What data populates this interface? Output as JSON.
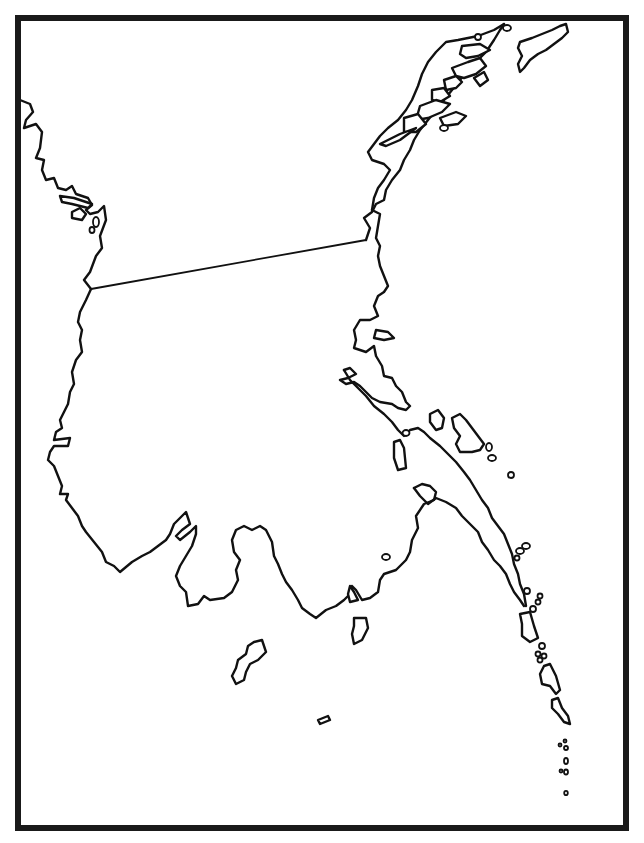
{
  "map": {
    "type": "blank-outline-map",
    "width": 644,
    "height": 843,
    "background_color": "#ffffff",
    "line_color": "#111111",
    "frame": {
      "style": "thick-hand-drawn-border",
      "color": "#1a1a1a",
      "x": 18,
      "y": 18,
      "width": 608,
      "height": 810
    },
    "labels": [],
    "features": [
      {
        "id": "northwest-coast",
        "kind": "coastline"
      },
      {
        "id": "northeast-coast-archipelago",
        "kind": "coastline"
      },
      {
        "id": "northeast-island",
        "kind": "island"
      },
      {
        "id": "land-boundary",
        "kind": "boundary-line",
        "from": [
          91,
          289
        ],
        "to": [
          366,
          240
        ]
      },
      {
        "id": "main-peninsula",
        "kind": "coastline"
      },
      {
        "id": "eastern-peninsula",
        "kind": "coastline"
      },
      {
        "id": "southern-islands",
        "kind": "island-group"
      },
      {
        "id": "southeast-island-chain",
        "kind": "island-group"
      }
    ]
  }
}
